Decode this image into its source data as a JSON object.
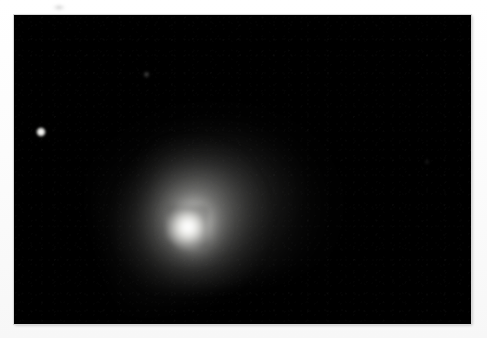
{
  "image": {
    "kind": "astronomical-photograph",
    "subject": "comet",
    "alt_text": "Black-and-white astronomical photograph of a comet showing a bright central nucleus surrounded by a diffuse coma that fans out toward the upper right, against a black star field",
    "width_px": 487,
    "height_px": 338,
    "background_color": "#ffffff",
    "plate": {
      "label": "photographic-plate",
      "color": "#000000",
      "left_px": 14,
      "top_px": 15,
      "width_px": 457,
      "height_px": 309
    },
    "objects": [
      {
        "name": "comet-nucleus",
        "description": "bright saturated central condensation",
        "x_px": 178,
        "y_px": 222,
        "brightness": "saturated-white",
        "color": "#ffffff"
      },
      {
        "name": "comet-coma",
        "description": "diffuse glowing envelope surrounding the nucleus",
        "center_x_px": 190,
        "center_y_px": 205,
        "radius_px": 80,
        "color": "#c8c8c5"
      },
      {
        "name": "comet-tail-fan",
        "description": "faint broad fan of dust extending up and to the right of the nucleus",
        "direction": "upper-right",
        "extent_px": 160,
        "color": "#6e6e6c"
      },
      {
        "name": "field-star-bright",
        "description": "small sharp star near the left edge of the plate",
        "x_px": 41,
        "y_px": 133,
        "size_px": 4,
        "color": "#ffffff"
      },
      {
        "name": "field-star-faint",
        "description": "very faint star in the upper left quadrant",
        "x_px": 147,
        "y_px": 76,
        "size_px": 2,
        "color": "#8a8a88"
      },
      {
        "name": "field-star-dim",
        "description": "barely visible speck toward the right of the plate",
        "x_px": 430,
        "y_px": 165,
        "size_px": 2,
        "color": "#4a4a49"
      }
    ],
    "artifacts": [
      {
        "name": "margin-smudge",
        "description": "small grey smudge on the white paper margin above the plate",
        "x_px": 58,
        "y_px": 8,
        "color": "#a8a8a8"
      }
    ]
  }
}
